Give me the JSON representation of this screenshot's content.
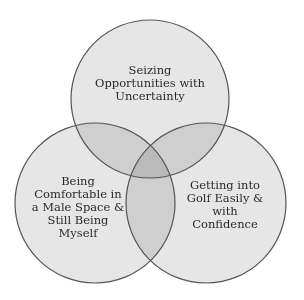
{
  "diagram": {
    "type": "venn",
    "background": "#ffffff",
    "fill_color": "#e6e6e6",
    "stroke_color": "#555555",
    "circles": [
      {
        "id": "top",
        "label": "Seizing\nOpportunities with\nUncertainty",
        "cx": 150,
        "cy": 99,
        "r": 79
      },
      {
        "id": "left",
        "label": "Being\nComfortable in\na Male Space &\nStill Being\nMyself",
        "cx": 95,
        "cy": 203,
        "r": 80
      },
      {
        "id": "right",
        "label": "Getting into\nGolf Easily &\nwith\nConfidence",
        "cx": 206,
        "cy": 203,
        "r": 80
      }
    ]
  }
}
